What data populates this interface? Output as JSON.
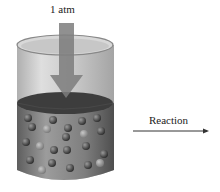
{
  "diagram": {
    "pressure_label": "1 atm",
    "reaction_label": "Reaction",
    "colors": {
      "cylinder": "#8a8a8a",
      "liquid": "#6f6f6f",
      "piston": "#3a3a3a",
      "arrow": "#7a7a7a",
      "particle": "#3c3c3c"
    }
  }
}
